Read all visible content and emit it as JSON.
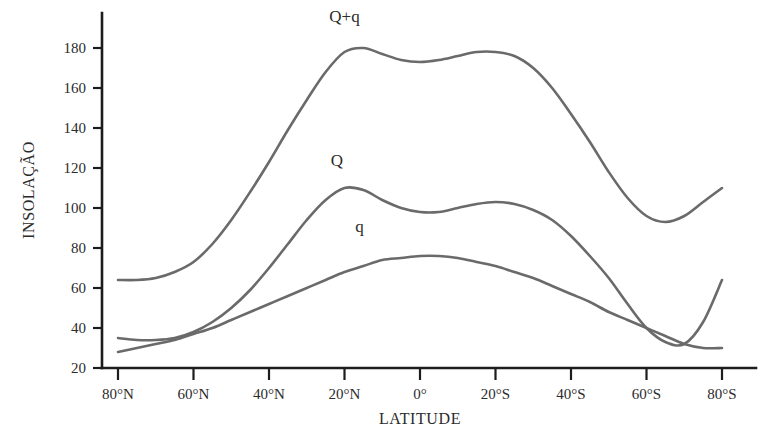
{
  "chart_data": {
    "type": "line",
    "title": "",
    "xlabel": "LATITUDE",
    "ylabel": "INSOLAÇÃO",
    "grid": false,
    "legend_position": "inline-labels",
    "xlim": [
      80,
      -80
    ],
    "ylim": [
      20,
      190
    ],
    "x_tick_labels": [
      "80°N",
      "60°N",
      "40°N",
      "20°N",
      "0°",
      "20°S",
      "40°S",
      "60°S",
      "80°S"
    ],
    "x_tick_values": [
      80,
      60,
      40,
      20,
      0,
      -20,
      -40,
      -60,
      -80
    ],
    "y_tick_labels": [
      "20",
      "40",
      "60",
      "80",
      "100",
      "120",
      "140",
      "160",
      "180"
    ],
    "y_tick_values": [
      20,
      40,
      60,
      80,
      100,
      120,
      140,
      160,
      180
    ],
    "x": [
      80,
      75,
      70,
      65,
      60,
      55,
      50,
      45,
      40,
      35,
      30,
      25,
      20,
      15,
      10,
      5,
      0,
      -5,
      -10,
      -15,
      -20,
      -25,
      -30,
      -35,
      -40,
      -45,
      -50,
      -55,
      -60,
      -65,
      -70,
      -75,
      -80
    ],
    "series": [
      {
        "name": "Q+q",
        "label": "Q+q",
        "color": "#6a6a6a",
        "label_x": 20,
        "label_y": 193,
        "values": [
          64,
          64,
          65,
          68,
          73,
          82,
          94,
          108,
          123,
          139,
          154,
          168,
          178,
          180,
          177,
          174,
          173,
          174,
          176,
          178,
          178,
          176,
          170,
          160,
          147,
          133,
          118,
          105,
          96,
          93,
          96,
          103,
          110
        ]
      },
      {
        "name": "Q",
        "label": "Q",
        "color": "#6a6a6a",
        "label_x": 22,
        "label_y": 121,
        "values": [
          35,
          34,
          34,
          35,
          38,
          43,
          50,
          59,
          70,
          82,
          94,
          104,
          110,
          109,
          104,
          100,
          98,
          98,
          100,
          102,
          103,
          102,
          99,
          94,
          86,
          76,
          65,
          52,
          40,
          33,
          32,
          43,
          64
        ]
      },
      {
        "name": "q",
        "label": "q",
        "color": "#6a6a6a",
        "label_x": 16,
        "label_y": 88,
        "values": [
          28,
          30,
          32,
          34,
          37,
          40,
          44,
          48,
          52,
          56,
          60,
          64,
          68,
          71,
          74,
          75,
          76,
          76,
          75,
          73,
          71,
          68,
          65,
          61,
          57,
          53,
          48,
          44,
          40,
          36,
          32,
          30,
          30
        ]
      }
    ]
  },
  "axes": {
    "y_axis_title": "INSOLAÇÃO",
    "x_axis_title": "LATITUDE"
  }
}
